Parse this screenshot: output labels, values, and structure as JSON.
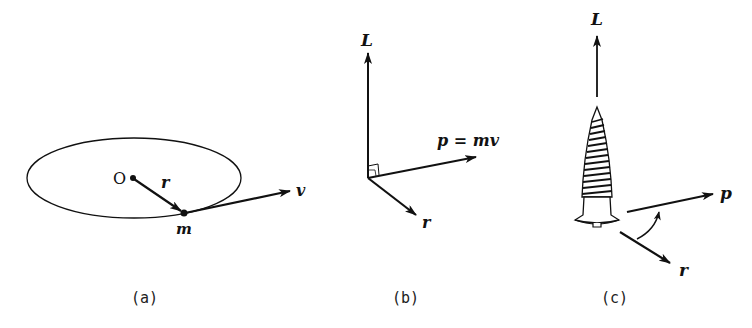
{
  "figure": {
    "panels": [
      {
        "id": "a",
        "caption": "(a)",
        "labels": {
          "origin": "O",
          "radius": "r",
          "velocity": "v",
          "mass": "m"
        }
      },
      {
        "id": "b",
        "caption": "(b)",
        "labels": {
          "angular_momentum": "L",
          "momentum": "p = mv",
          "radius": "r"
        }
      },
      {
        "id": "c",
        "caption": "(c)",
        "labels": {
          "angular_momentum": "L",
          "momentum": "p",
          "radius": "r"
        }
      }
    ]
  },
  "colors": {
    "ink": "#111111",
    "background": "#ffffff"
  }
}
